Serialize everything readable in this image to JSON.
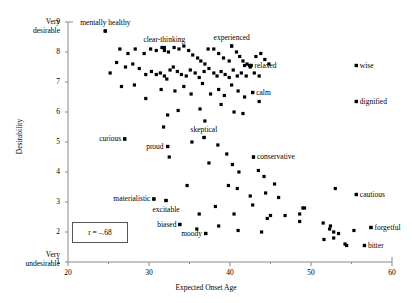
{
  "chart_data": {
    "type": "scatter",
    "title": "",
    "xlabel": "Expected Onset Age",
    "ylabel": "Desirability",
    "xlim": [
      20,
      60
    ],
    "ylim": [
      1,
      9
    ],
    "xticks": [
      20,
      30,
      40,
      50,
      60
    ],
    "xminorticks": [
      25,
      35,
      45,
      55
    ],
    "yticks": [
      1,
      2,
      3,
      4,
      5,
      6,
      7,
      8,
      9
    ],
    "grid": false,
    "legend": null,
    "axis_end_labels": {
      "y_top_line1": "Very",
      "y_top_line2": "desirable",
      "y_bottom_line1": "Very",
      "y_bottom_line2": "undesirable"
    },
    "annotations": [
      {
        "text": "r = –.68",
        "type": "boxed-statistic"
      }
    ],
    "labeled_points": [
      {
        "label": "mentally healthy",
        "x": 24.6,
        "y": 8.7,
        "label_pos": "above"
      },
      {
        "label": "clear-thinking",
        "x": 31.9,
        "y": 8.15,
        "label_pos": "above"
      },
      {
        "label": "experienced",
        "x": 40.2,
        "y": 8.2,
        "label_pos": "above"
      },
      {
        "label": "relaxed",
        "x": 42.6,
        "y": 7.55,
        "label_pos": "right"
      },
      {
        "label": "wise",
        "x": 55.6,
        "y": 7.55,
        "label_pos": "right"
      },
      {
        "label": "calm",
        "x": 42.8,
        "y": 6.65,
        "label_pos": "right"
      },
      {
        "label": "dignified",
        "x": 55.6,
        "y": 6.35,
        "label_pos": "right"
      },
      {
        "label": "curious",
        "x": 27.0,
        "y": 5.1,
        "label_pos": "left"
      },
      {
        "label": "proud",
        "x": 32.3,
        "y": 4.85,
        "label_pos": "left"
      },
      {
        "label": "skeptical",
        "x": 36.8,
        "y": 5.15,
        "label_pos": "above"
      },
      {
        "label": "conservative",
        "x": 42.9,
        "y": 4.5,
        "label_pos": "right"
      },
      {
        "label": "materialistic",
        "x": 30.6,
        "y": 3.1,
        "label_pos": "left"
      },
      {
        "label": "excitable",
        "x": 32.1,
        "y": 3.05,
        "label_pos": "below"
      },
      {
        "label": "cautious",
        "x": 55.6,
        "y": 3.25,
        "label_pos": "right"
      },
      {
        "label": "biased",
        "x": 33.8,
        "y": 2.25,
        "label_pos": "left"
      },
      {
        "label": "moody",
        "x": 37.0,
        "y": 1.95,
        "label_pos": "left"
      },
      {
        "label": "forgetful",
        "x": 57.4,
        "y": 2.15,
        "label_pos": "right"
      },
      {
        "label": "bitter",
        "x": 56.6,
        "y": 1.55,
        "label_pos": "right"
      }
    ],
    "points": [
      [
        24.6,
        8.7
      ],
      [
        26.4,
        8.1
      ],
      [
        27.4,
        7.95
      ],
      [
        28.3,
        8.1
      ],
      [
        29.4,
        7.95
      ],
      [
        30.2,
        8.1
      ],
      [
        30.9,
        8.05
      ],
      [
        31.6,
        8.15
      ],
      [
        31.9,
        8.05
      ],
      [
        32.4,
        8.0
      ],
      [
        33.1,
        8.15
      ],
      [
        33.7,
        8.1
      ],
      [
        34.3,
        8.2
      ],
      [
        34.9,
        8.05
      ],
      [
        35.4,
        7.9
      ],
      [
        36.0,
        7.8
      ],
      [
        36.4,
        7.7
      ],
      [
        36.9,
        7.6
      ],
      [
        37.3,
        8.1
      ],
      [
        38.0,
        8.1
      ],
      [
        38.6,
        7.95
      ],
      [
        39.2,
        7.8
      ],
      [
        39.9,
        7.7
      ],
      [
        40.2,
        8.2
      ],
      [
        40.8,
        8.0
      ],
      [
        41.2,
        7.85
      ],
      [
        41.6,
        7.7
      ],
      [
        41.8,
        7.55
      ],
      [
        42.1,
        7.6
      ],
      [
        42.4,
        7.55
      ],
      [
        42.6,
        7.55
      ],
      [
        43.2,
        7.85
      ],
      [
        43.8,
        7.95
      ],
      [
        44.3,
        7.75
      ],
      [
        44.8,
        7.6
      ],
      [
        25.2,
        7.3
      ],
      [
        26.0,
        7.65
      ],
      [
        27.1,
        7.5
      ],
      [
        28.0,
        7.6
      ],
      [
        28.8,
        7.45
      ],
      [
        29.6,
        7.25
      ],
      [
        30.3,
        7.35
      ],
      [
        30.9,
        7.25
      ],
      [
        31.4,
        7.3
      ],
      [
        31.9,
        7.2
      ],
      [
        32.2,
        7.1
      ],
      [
        32.6,
        7.4
      ],
      [
        33.0,
        7.5
      ],
      [
        33.5,
        7.35
      ],
      [
        34.0,
        7.25
      ],
      [
        34.6,
        7.2
      ],
      [
        35.1,
        7.4
      ],
      [
        35.7,
        7.3
      ],
      [
        36.2,
        7.15
      ],
      [
        36.8,
        7.35
      ],
      [
        37.4,
        7.45
      ],
      [
        38.0,
        7.3
      ],
      [
        38.4,
        7.2
      ],
      [
        38.9,
        7.35
      ],
      [
        39.4,
        7.25
      ],
      [
        39.9,
        7.15
      ],
      [
        40.4,
        7.4
      ],
      [
        40.9,
        7.2
      ],
      [
        41.4,
        7.3
      ],
      [
        42.0,
        7.2
      ],
      [
        42.5,
        7.5
      ],
      [
        43.0,
        7.3
      ],
      [
        43.6,
        7.2
      ],
      [
        26.6,
        6.85
      ],
      [
        28.2,
        6.9
      ],
      [
        29.6,
        6.45
      ],
      [
        31.5,
        6.75
      ],
      [
        33.2,
        6.7
      ],
      [
        34.3,
        6.85
      ],
      [
        35.2,
        6.6
      ],
      [
        36.6,
        6.95
      ],
      [
        37.6,
        6.6
      ],
      [
        38.6,
        6.75
      ],
      [
        39.3,
        6.55
      ],
      [
        40.2,
        6.9
      ],
      [
        41.0,
        6.7
      ],
      [
        41.8,
        6.5
      ],
      [
        42.8,
        6.65
      ],
      [
        43.6,
        6.35
      ],
      [
        55.6,
        6.35
      ],
      [
        32.3,
        5.9
      ],
      [
        33.6,
        6.05
      ],
      [
        36.3,
        6.1
      ],
      [
        38.9,
        6.25
      ],
      [
        40.5,
        6.0
      ],
      [
        41.6,
        5.95
      ],
      [
        36.9,
        5.7
      ],
      [
        55.6,
        7.55
      ],
      [
        27.0,
        5.1
      ],
      [
        32.3,
        4.85
      ],
      [
        36.8,
        5.15
      ],
      [
        32.5,
        4.5
      ],
      [
        42.9,
        4.5
      ],
      [
        38.5,
        4.9
      ],
      [
        39.6,
        4.6
      ],
      [
        40.3,
        4.25
      ],
      [
        37.4,
        4.3
      ],
      [
        41.1,
        4.0
      ],
      [
        43.5,
        4.05
      ],
      [
        44.2,
        3.85
      ],
      [
        45.5,
        3.6
      ],
      [
        39.8,
        3.55
      ],
      [
        40.9,
        3.45
      ],
      [
        30.6,
        3.1
      ],
      [
        32.1,
        3.05
      ],
      [
        34.7,
        3.55
      ],
      [
        42.5,
        3.2
      ],
      [
        44.4,
        3.3
      ],
      [
        46.0,
        3.15
      ],
      [
        55.6,
        3.25
      ],
      [
        53.0,
        3.45
      ],
      [
        38.2,
        2.85
      ],
      [
        40.5,
        2.6
      ],
      [
        42.8,
        2.9
      ],
      [
        44.6,
        2.45
      ],
      [
        46.8,
        2.55
      ],
      [
        48.6,
        2.6
      ],
      [
        49.0,
        2.8
      ],
      [
        49.2,
        2.8
      ],
      [
        48.6,
        2.35
      ],
      [
        33.8,
        2.25
      ],
      [
        37.0,
        1.95
      ],
      [
        38.6,
        2.2
      ],
      [
        35.9,
        2.1
      ],
      [
        41.0,
        2.05
      ],
      [
        43.9,
        2.0
      ],
      [
        51.5,
        2.3
      ],
      [
        52.4,
        2.2
      ],
      [
        52.3,
        2.1
      ],
      [
        52.8,
        2.0
      ],
      [
        53.4,
        1.95
      ],
      [
        51.6,
        1.75
      ],
      [
        52.8,
        1.8
      ],
      [
        54.2,
        1.6
      ],
      [
        55.3,
        2.05
      ],
      [
        57.4,
        2.15
      ],
      [
        56.6,
        1.55
      ],
      [
        54.4,
        1.55
      ],
      [
        36.2,
        2.6
      ],
      [
        45.0,
        2.55
      ],
      [
        31.8,
        5.5
      ],
      [
        35.3,
        5.0
      ]
    ]
  }
}
